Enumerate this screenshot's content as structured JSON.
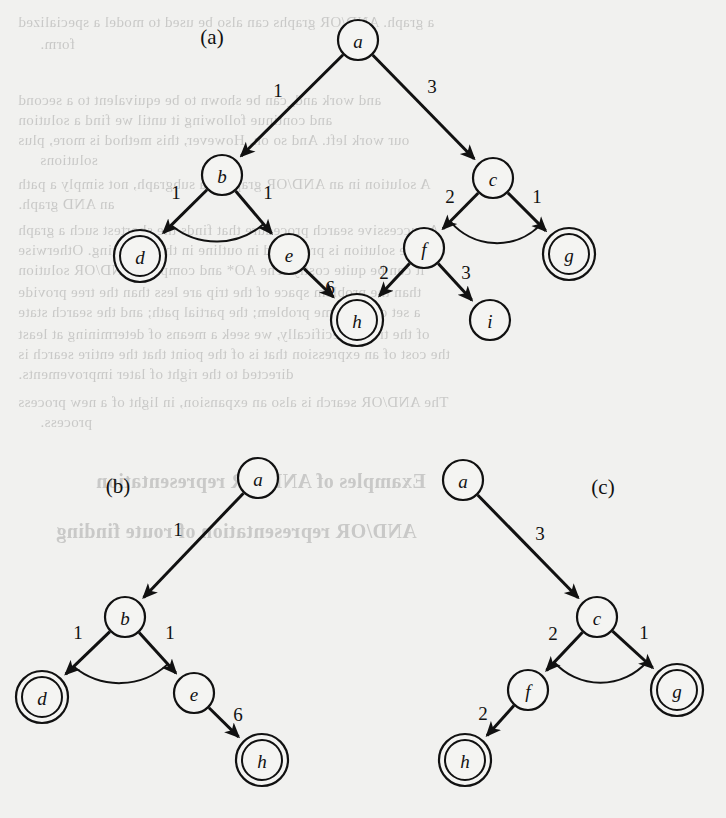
{
  "figure": {
    "caption_labels": [
      "(a)",
      "(b)",
      "(c)"
    ],
    "node_radius": 20,
    "goal_ring_radius": 26,
    "colors": {
      "ink": "#111111",
      "paper": "#f1f1ef",
      "node_fill": "#f4f4f2"
    }
  },
  "panels": [
    {
      "id": "a",
      "label": "(a)",
      "label_pos": {
        "x": 212,
        "y": 37
      },
      "nodes": [
        {
          "id": "a",
          "text": "a",
          "x": 358,
          "y": 40,
          "goal": false
        },
        {
          "id": "b",
          "text": "b",
          "x": 222,
          "y": 175,
          "goal": false
        },
        {
          "id": "c",
          "text": "c",
          "x": 493,
          "y": 178,
          "goal": false
        },
        {
          "id": "d",
          "text": "d",
          "x": 140,
          "y": 256,
          "goal": true
        },
        {
          "id": "e",
          "text": "e",
          "x": 289,
          "y": 254,
          "goal": false
        },
        {
          "id": "f",
          "text": "f",
          "x": 424,
          "y": 248,
          "goal": false
        },
        {
          "id": "g",
          "text": "g",
          "x": 569,
          "y": 254,
          "goal": true
        },
        {
          "id": "h",
          "text": "h",
          "x": 357,
          "y": 320,
          "goal": true
        },
        {
          "id": "i",
          "text": "i",
          "x": 490,
          "y": 320,
          "goal": false
        }
      ],
      "edges": [
        {
          "from": "a",
          "to": "b",
          "weight": "1",
          "label_pos": {
            "x": 278,
            "y": 90
          }
        },
        {
          "from": "a",
          "to": "c",
          "weight": "3",
          "label_pos": {
            "x": 432,
            "y": 86
          }
        },
        {
          "from": "b",
          "to": "d",
          "weight": "1",
          "label_pos": {
            "x": 176,
            "y": 192
          }
        },
        {
          "from": "b",
          "to": "e",
          "weight": "1",
          "label_pos": {
            "x": 268,
            "y": 192
          }
        },
        {
          "from": "c",
          "to": "f",
          "weight": "2",
          "label_pos": {
            "x": 450,
            "y": 196
          }
        },
        {
          "from": "c",
          "to": "g",
          "weight": "1",
          "label_pos": {
            "x": 537,
            "y": 196
          }
        },
        {
          "from": "e",
          "to": "h",
          "weight": "6",
          "label_pos": {
            "x": 330,
            "y": 287
          }
        },
        {
          "from": "f",
          "to": "h",
          "weight": "2",
          "label_pos": {
            "x": 384,
            "y": 272
          }
        },
        {
          "from": "f",
          "to": "i",
          "weight": "3",
          "label_pos": {
            "x": 466,
            "y": 272
          }
        }
      ],
      "and_connectors": [
        {
          "parent": "b",
          "children": [
            "d",
            "e"
          ]
        },
        {
          "parent": "c",
          "children": [
            "f",
            "g"
          ]
        }
      ]
    },
    {
      "id": "b",
      "label": "(b)",
      "label_pos": {
        "x": 118,
        "y": 486
      },
      "nodes": [
        {
          "id": "a",
          "text": "a",
          "x": 258,
          "y": 478,
          "goal": false
        },
        {
          "id": "b",
          "text": "b",
          "x": 125,
          "y": 617,
          "goal": false
        },
        {
          "id": "d",
          "text": "d",
          "x": 42,
          "y": 697,
          "goal": true
        },
        {
          "id": "e",
          "text": "e",
          "x": 194,
          "y": 693,
          "goal": false
        },
        {
          "id": "h",
          "text": "h",
          "x": 262,
          "y": 760,
          "goal": true
        }
      ],
      "edges": [
        {
          "from": "a",
          "to": "b",
          "weight": "1",
          "label_pos": {
            "x": 178,
            "y": 529
          }
        },
        {
          "from": "b",
          "to": "d",
          "weight": "1",
          "label_pos": {
            "x": 78,
            "y": 632
          }
        },
        {
          "from": "b",
          "to": "e",
          "weight": "1",
          "label_pos": {
            "x": 170,
            "y": 632
          }
        },
        {
          "from": "e",
          "to": "h",
          "weight": "6",
          "label_pos": {
            "x": 238,
            "y": 714
          }
        }
      ],
      "and_connectors": [
        {
          "parent": "b",
          "children": [
            "d",
            "e"
          ]
        }
      ]
    },
    {
      "id": "c",
      "label": "(c)",
      "label_pos": {
        "x": 603,
        "y": 487
      },
      "nodes": [
        {
          "id": "a",
          "text": "a",
          "x": 463,
          "y": 480,
          "goal": false
        },
        {
          "id": "c",
          "text": "c",
          "x": 597,
          "y": 617,
          "goal": false
        },
        {
          "id": "f",
          "text": "f",
          "x": 528,
          "y": 690,
          "goal": false
        },
        {
          "id": "g",
          "text": "g",
          "x": 677,
          "y": 690,
          "goal": true
        },
        {
          "id": "h",
          "text": "h",
          "x": 465,
          "y": 760,
          "goal": true
        }
      ],
      "edges": [
        {
          "from": "a",
          "to": "c",
          "weight": "3",
          "label_pos": {
            "x": 540,
            "y": 533
          }
        },
        {
          "from": "c",
          "to": "f",
          "weight": "2",
          "label_pos": {
            "x": 553,
            "y": 633
          }
        },
        {
          "from": "c",
          "to": "g",
          "weight": "1",
          "label_pos": {
            "x": 644,
            "y": 632
          }
        },
        {
          "from": "f",
          "to": "h",
          "weight": "2",
          "label_pos": {
            "x": 483,
            "y": 713
          }
        }
      ],
      "and_connectors": [
        {
          "parent": "c",
          "children": [
            "f",
            "g"
          ]
        }
      ]
    }
  ],
  "background_text": [
    {
      "text": "a graph. AND/OR graphs can also be used to model a specialized",
      "x": 18,
      "y": 14
    },
    {
      "text": "form.",
      "x": 40,
      "y": 36
    },
    {
      "text": "and work and_can be shown to be equivalent to a second",
      "x": 18,
      "y": 92
    },
    {
      "text": "and continue following it until we find a solution",
      "x": 18,
      "y": 112
    },
    {
      "text": "our work left. And so on. However, this method is more, plus",
      "x": 18,
      "y": 132
    },
    {
      "text": "solutions",
      "x": 40,
      "y": 152
    },
    {
      "text": "A solution in an AND/OR graph is a subgraph, not simply a path",
      "x": 18,
      "y": 176
    },
    {
      "text": "an AND graph.",
      "x": 18,
      "y": 196
    },
    {
      "text": "A successive search procedure that finds the shortest such a graph",
      "x": 18,
      "y": 222
    },
    {
      "text": "and the solution is presented in outline in the following. Otherwise",
      "x": 18,
      "y": 242
    },
    {
      "text": "it can be quite costly. The AO* and complete AND/OR solution",
      "x": 18,
      "y": 262
    },
    {
      "text": "than the problem space of the trip are less than the tree provide",
      "x": 18,
      "y": 284
    },
    {
      "text": "a set of the same problem; the partial path; and the search state",
      "x": 18,
      "y": 304
    },
    {
      "text": "of the tree. Specifically, we seek a means of determining at least",
      "x": 18,
      "y": 326
    },
    {
      "text": "the cost of an expression that is of the point that the entire search is",
      "x": 18,
      "y": 346
    },
    {
      "text": "directed to the right of later improvements.",
      "x": 18,
      "y": 366
    },
    {
      "text": "The AND/OR search is also an expansion, in light of a new process",
      "x": 18,
      "y": 394
    },
    {
      "text": "process.",
      "x": 40,
      "y": 414
    },
    {
      "text": "Examples of AND/OR representation",
      "x": 96,
      "y": 470,
      "bold": true
    },
    {
      "text": "AND/OR representation of route finding",
      "x": 56,
      "y": 520,
      "bold": true
    }
  ]
}
